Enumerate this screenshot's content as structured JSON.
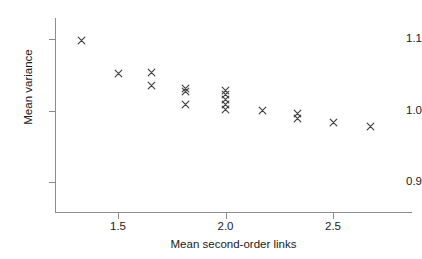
{
  "chart_data": {
    "type": "scatter",
    "title": "",
    "xlabel": "Mean second-order links",
    "ylabel": "Mean variance",
    "xlim": [
      1.2,
      2.86
    ],
    "ylim": [
      0.855,
      1.125
    ],
    "xticks": [
      1.5,
      2.0,
      2.5
    ],
    "xtick_labels": [
      "1.5",
      "2.0",
      "2.5"
    ],
    "yticks": [
      0.9,
      1.0,
      1.1
    ],
    "ytick_labels": [
      "0.9",
      "1.0",
      "1.1"
    ],
    "grid": false,
    "legend": null,
    "marker": "x",
    "marker_color": "#404040",
    "axis_color": "#8c8c8c",
    "background": "#ffffff",
    "series": [
      {
        "name": "observations",
        "points": [
          {
            "x": 1.33,
            "y": 1.098
          },
          {
            "x": 1.5,
            "y": 1.052
          },
          {
            "x": 1.655,
            "y": 1.053
          },
          {
            "x": 1.655,
            "y": 1.035
          },
          {
            "x": 1.815,
            "y": 1.031
          },
          {
            "x": 1.815,
            "y": 1.026
          },
          {
            "x": 1.815,
            "y": 1.008
          },
          {
            "x": 2.0,
            "y": 1.028
          },
          {
            "x": 2.0,
            "y": 1.022
          },
          {
            "x": 2.0,
            "y": 1.016
          },
          {
            "x": 2.0,
            "y": 1.009
          },
          {
            "x": 2.0,
            "y": 1.002
          },
          {
            "x": 2.17,
            "y": 1.0
          },
          {
            "x": 2.335,
            "y": 0.996
          },
          {
            "x": 2.335,
            "y": 0.989
          },
          {
            "x": 2.5,
            "y": 0.983
          },
          {
            "x": 2.675,
            "y": 0.978
          }
        ]
      }
    ]
  }
}
